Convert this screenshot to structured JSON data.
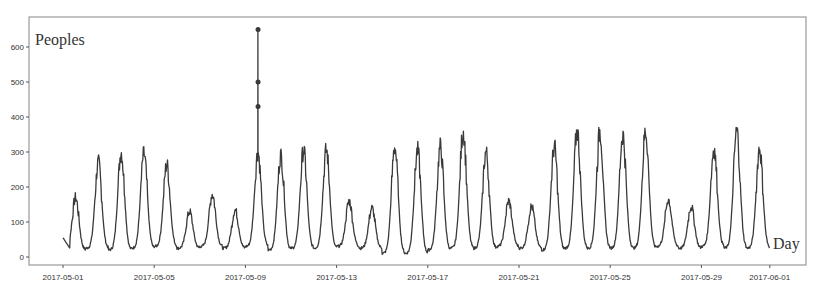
{
  "chart_data": {
    "type": "line",
    "title": "",
    "ylabel": "Peoples",
    "xlabel": "Day",
    "ylim": [
      0,
      660
    ],
    "xlim": [
      "2017-05-01",
      "2017-06-01"
    ],
    "grid": false,
    "legend": null,
    "y_ticks": [
      0,
      100,
      200,
      300,
      400,
      500,
      600
    ],
    "x_ticks": [
      "2017-05-01",
      "2017-05-05",
      "2017-05-09",
      "2017-05-13",
      "2017-05-17",
      "2017-05-21",
      "2017-05-25",
      "2017-05-29",
      "2017-06-01"
    ],
    "x_tick_day_offsets": [
      0,
      4,
      8,
      12,
      16,
      20,
      24,
      28,
      31
    ],
    "series": [
      {
        "name": "Peoples",
        "resolution": "daily summary of an intraday series (peak / trough)",
        "days": [
          "2017-05-01",
          "2017-05-02",
          "2017-05-03",
          "2017-05-04",
          "2017-05-05",
          "2017-05-06",
          "2017-05-07",
          "2017-05-08",
          "2017-05-09",
          "2017-05-10",
          "2017-05-11",
          "2017-05-12",
          "2017-05-13",
          "2017-05-14",
          "2017-05-15",
          "2017-05-16",
          "2017-05-17",
          "2017-05-18",
          "2017-05-19",
          "2017-05-20",
          "2017-05-21",
          "2017-05-22",
          "2017-05-23",
          "2017-05-24",
          "2017-05-25",
          "2017-05-26",
          "2017-05-27",
          "2017-05-28",
          "2017-05-29",
          "2017-05-30",
          "2017-05-31"
        ],
        "daily_peak": [
          170,
          270,
          300,
          295,
          265,
          130,
          180,
          135,
          650,
          290,
          305,
          305,
          160,
          140,
          315,
          305,
          315,
          360,
          300,
          160,
          145,
          315,
          360,
          360,
          350,
          360,
          165,
          145,
          310,
          360,
          310
        ],
        "daily_min": [
          20,
          25,
          20,
          25,
          30,
          25,
          30,
          25,
          30,
          20,
          25,
          25,
          30,
          25,
          10,
          10,
          20,
          25,
          25,
          30,
          25,
          20,
          25,
          25,
          25,
          25,
          30,
          25,
          30,
          25,
          25
        ]
      }
    ],
    "annotations": [
      {
        "text": "spike markers",
        "x": "2017-05-09",
        "values": [
          650,
          500,
          430
        ]
      }
    ]
  }
}
